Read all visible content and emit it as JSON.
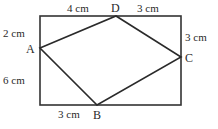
{
  "diagram": {
    "type": "geometry",
    "colors": {
      "line": "#2a2a2a",
      "background": "#ffffff"
    },
    "rectangle": {
      "x": 40,
      "y": 16,
      "width": 141,
      "height": 89
    },
    "points": {
      "A": {
        "label": "A",
        "x": 40,
        "y": 48
      },
      "B": {
        "label": "B",
        "x": 97,
        "y": 105
      },
      "C": {
        "label": "C",
        "x": 181,
        "y": 57
      },
      "D": {
        "label": "D",
        "x": 116,
        "y": 16
      }
    },
    "quadrilateral": "ABCD",
    "measurements": {
      "top_left_segment": "4 cm",
      "top_right_segment": "3 cm",
      "left_upper_segment": "2 cm",
      "left_lower_segment": "6 cm",
      "right_upper_segment": "3 cm",
      "bottom_left_segment": "3 cm"
    }
  }
}
